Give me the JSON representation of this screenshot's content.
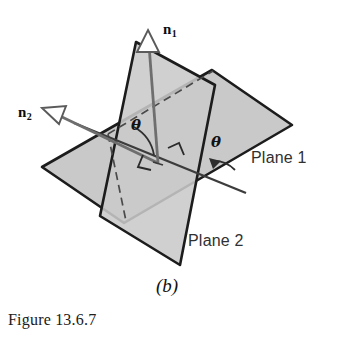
{
  "figure": {
    "caption": "Figure 13.6.7",
    "part_label": "(b)",
    "colors": {
      "plane_fill": "#c9c9c9",
      "plane_edge": "#1c1c1c",
      "vector_line": "#6e6e6e",
      "hidden_edge": "#4a4a4a",
      "background": "#ffffff",
      "text": "#1a1a1a"
    }
  },
  "labels": {
    "normal_1": {
      "symbol": "n",
      "subscript": "1"
    },
    "normal_2": {
      "symbol": "n",
      "subscript": "2"
    },
    "angle_between_normals": "θ",
    "angle_between_planes": "θ",
    "plane_1": "Plane 1",
    "plane_2": "Plane 2"
  },
  "geometry": {
    "plane_1": {
      "name": "Plane 1",
      "orientation": "near-horizontal parallelogram",
      "vertices": "42,167 212,70 292,125 124,223"
    },
    "plane_2": {
      "name": "Plane 2",
      "orientation": "near-vertical parallelogram",
      "vertices": "136,42 215,85 180,265 100,216"
    },
    "normal_1_vector": {
      "from": "158,163",
      "to": "147,38",
      "arrowhead": "open-triangle"
    },
    "normal_2_vector": {
      "from": "158,163",
      "to": "52,112",
      "arrowhead": "open-triangle"
    },
    "intersection_line": {
      "from": "86,128",
      "to": "240,190"
    },
    "hidden_edge": {
      "style": "dashed",
      "from": "110,133",
      "to": "212,70"
    },
    "right_angle_marks": 2,
    "angle_arcs": 2
  }
}
